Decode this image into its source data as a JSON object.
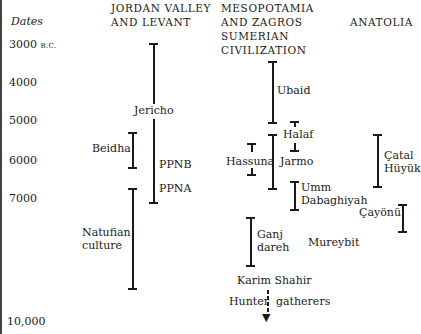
{
  "axis": {
    "label": "Dates",
    "ticks": [
      {
        "label": "3000",
        "suffix": "B.C.",
        "y": 45
      },
      {
        "label": "4000",
        "y": 83
      },
      {
        "label": "5000",
        "y": 120
      },
      {
        "label": "6000",
        "y": 160
      },
      {
        "label": "7000",
        "y": 198
      },
      {
        "label": "10,000",
        "y": 322
      }
    ]
  },
  "columns": {
    "levant": {
      "line1": "JORDAN VALLEY",
      "line2": "AND LEVANT"
    },
    "mesopotamia": {
      "line1": "MESOPOTAMIA",
      "line2": "AND ZAGROS",
      "line3": "SUMERIAN",
      "line4": "CIVILIZATION"
    },
    "anatolia": {
      "line1": "ANATOLIA"
    }
  },
  "sites": {
    "jericho": "Jericho",
    "beidha": "Beidha",
    "ppnb": "PPNB",
    "ppna": "PPNA",
    "natufian_1": "Natufian",
    "natufian_2": "culture",
    "ubaid": "Ubaid",
    "halaf": "Halaf",
    "hassuna": "Hassuna",
    "jarmo": "Jarmo",
    "umm_1": "Umm",
    "umm_2": "Dabaghiyah",
    "catal_1": "Çatal",
    "catal_2": "Hüyük",
    "cayonu": "Çayönü",
    "ganj_1": "Ganj",
    "ganj_2": "dareh",
    "mureybit": "Mureybit",
    "karim": "Karim  Shahir",
    "hunter_1": "Hunter",
    "hunter_2": "gatherers"
  }
}
